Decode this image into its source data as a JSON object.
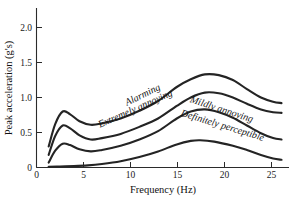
{
  "chart_data": {
    "type": "line",
    "title": "",
    "subtitle": "",
    "xlabel": "Frequency (Hz)",
    "ylabel": "Peak acceleration (g's)",
    "xlim": [
      0,
      27
    ],
    "ylim": [
      0,
      2.2
    ],
    "xticks": [
      0,
      5,
      10,
      15,
      20,
      25
    ],
    "xtick_labels": [
      "0",
      "5",
      "10",
      "15",
      "20",
      "25"
    ],
    "yticks": [
      0,
      0.5,
      1.0,
      1.5,
      2.0
    ],
    "ytick_labels": [
      "0",
      "0.5",
      "1.0",
      "1.5",
      "2.0"
    ],
    "grid": false,
    "legend": "inline-curve-labels",
    "series": [
      {
        "name": "Alarming",
        "label": "Alarming",
        "x": [
          1.3,
          2.0,
          2.8,
          3.6,
          4.6,
          5.8,
          7.0,
          9.0,
          11.0,
          13.0,
          15.0,
          16.5,
          18.0,
          19.5,
          21.0,
          22.5,
          24.0,
          25.3,
          26.2
        ],
        "y": [
          0.3,
          0.62,
          0.8,
          0.76,
          0.66,
          0.61,
          0.63,
          0.7,
          0.81,
          0.95,
          1.15,
          1.26,
          1.33,
          1.32,
          1.25,
          1.12,
          1.0,
          0.94,
          0.92
        ]
      },
      {
        "name": "Extremely annoying",
        "label": "Extremely annoying",
        "x": [
          1.3,
          2.0,
          2.8,
          3.6,
          4.6,
          5.8,
          7.0,
          9.0,
          11.0,
          13.0,
          15.0,
          16.5,
          18.0,
          19.5,
          21.0,
          22.5,
          24.0,
          25.3,
          26.2
        ],
        "y": [
          0.18,
          0.45,
          0.6,
          0.56,
          0.46,
          0.4,
          0.42,
          0.48,
          0.58,
          0.7,
          0.88,
          1.0,
          1.07,
          1.06,
          1.0,
          0.91,
          0.83,
          0.79,
          0.78
        ]
      },
      {
        "name": "Mildly annoying",
        "label": "Mildly annoying",
        "x": [
          1.3,
          2.0,
          2.8,
          3.6,
          4.6,
          5.8,
          7.0,
          9.0,
          11.0,
          13.0,
          15.0,
          16.5,
          18.0,
          19.5,
          21.0,
          22.5,
          24.0,
          25.3,
          26.2
        ],
        "y": [
          0.07,
          0.24,
          0.34,
          0.32,
          0.26,
          0.23,
          0.25,
          0.31,
          0.4,
          0.52,
          0.7,
          0.8,
          0.83,
          0.79,
          0.71,
          0.6,
          0.49,
          0.42,
          0.4
        ]
      },
      {
        "name": "Definitely perceptible",
        "label": "Definitely perceptible",
        "x": [
          1.3,
          2.5,
          4.0,
          5.5,
          7.0,
          9.0,
          11.0,
          13.0,
          15.0,
          16.5,
          17.5,
          19.0,
          21.0,
          22.5,
          24.0,
          25.3,
          26.2
        ],
        "y": [
          0.01,
          0.015,
          0.02,
          0.03,
          0.05,
          0.09,
          0.15,
          0.23,
          0.33,
          0.38,
          0.39,
          0.37,
          0.31,
          0.25,
          0.18,
          0.13,
          0.11
        ]
      }
    ],
    "annotations": [
      {
        "text": "Alarming",
        "x": 11.5,
        "y": 1.0,
        "rotation": -26
      },
      {
        "text": "Extremely annoying",
        "x": 10.7,
        "y": 0.8,
        "rotation": -24
      },
      {
        "text": "Mildly annoying",
        "x": 19.7,
        "y": 0.79,
        "rotation": 18
      },
      {
        "text": "Definitely perceptible",
        "x": 19.8,
        "y": 0.56,
        "rotation": 17
      }
    ],
    "colors": {
      "curve": "#242424",
      "axis": "#2b2b2b",
      "background": "#ffffff",
      "text": "#111111"
    }
  }
}
